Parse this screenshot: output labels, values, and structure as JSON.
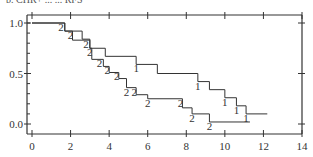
{
  "caption": "b. CHR+ ... ... RFS",
  "chart_data": {
    "type": "line",
    "subtype": "kaplan-meier-step",
    "title": "",
    "xlabel": "",
    "ylabel": "",
    "xlim": [
      0,
      14
    ],
    "ylim": [
      0.0,
      1.0
    ],
    "x_ticks": [
      0,
      2,
      4,
      6,
      8,
      10,
      12,
      14
    ],
    "x_tick_labels": [
      "0",
      "2",
      "4",
      "6",
      "8",
      "10",
      "12",
      "14"
    ],
    "y_ticks": [
      0.0,
      0.5,
      1.0
    ],
    "y_tick_labels": [
      "0.0",
      "0.5",
      "1.0"
    ],
    "grid": false,
    "legend": "none",
    "series": [
      {
        "name": "1",
        "marker_label": "1",
        "steps": [
          {
            "x": 0.0,
            "y": 1.0
          },
          {
            "x": 1.7,
            "y": 0.92
          },
          {
            "x": 2.6,
            "y": 0.84
          },
          {
            "x": 3.0,
            "y": 0.75
          },
          {
            "x": 3.8,
            "y": 0.67
          },
          {
            "x": 5.4,
            "y": 0.59
          },
          {
            "x": 6.5,
            "y": 0.5
          },
          {
            "x": 8.6,
            "y": 0.42
          },
          {
            "x": 9.2,
            "y": 0.34
          },
          {
            "x": 10.0,
            "y": 0.26
          },
          {
            "x": 10.6,
            "y": 0.18
          },
          {
            "x": 11.1,
            "y": 0.1
          }
        ],
        "end_x": 12.2,
        "censor_labels_at": [
          5.4,
          8.6,
          10.0,
          10.6,
          11.1
        ]
      },
      {
        "name": "2",
        "marker_label": "2",
        "steps": [
          {
            "x": 0.0,
            "y": 1.0
          },
          {
            "x": 1.7,
            "y": 0.92
          },
          {
            "x": 2.1,
            "y": 0.83
          },
          {
            "x": 3.0,
            "y": 0.75
          },
          {
            "x": 3.1,
            "y": 0.64
          },
          {
            "x": 3.7,
            "y": 0.57
          },
          {
            "x": 4.0,
            "y": 0.51
          },
          {
            "x": 4.5,
            "y": 0.45
          },
          {
            "x": 4.9,
            "y": 0.36
          },
          {
            "x": 5.4,
            "y": 0.29
          },
          {
            "x": 6.0,
            "y": 0.25
          },
          {
            "x": 7.8,
            "y": 0.16
          },
          {
            "x": 8.3,
            "y": 0.1
          },
          {
            "x": 9.2,
            "y": 0.02
          }
        ],
        "end_x": 11.3,
        "censor_labels_at": [
          1.5,
          2.0,
          2.8,
          3.0,
          3.5,
          3.9,
          4.4,
          4.9,
          5.3,
          6.0,
          7.7,
          8.3,
          9.2
        ]
      }
    ]
  }
}
